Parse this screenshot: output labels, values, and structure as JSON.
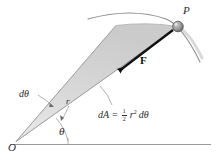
{
  "figure": {
    "type": "physics-diagram",
    "background_color": "#ffffff",
    "shade_color": "#d7d7d7",
    "line_color": "#6e6e6e",
    "vector_color": "#111111",
    "text_color": "#2b2b2b"
  },
  "labels": {
    "point_p": "P",
    "force": "F",
    "d_theta": "dθ",
    "radius": "r",
    "theta": "θ",
    "origin": "O"
  },
  "formula": {
    "lhs": "dA",
    "equals": "=",
    "fraction_numerator": "1",
    "fraction_denominator": "2",
    "radius_symbol": "r",
    "radius_exponent": "2",
    "differential": "dθ",
    "full_text": "dA = 1/2 r² dθ"
  },
  "geometry": {
    "origin_point": [
      16,
      141
    ],
    "point_p": [
      178,
      26
    ],
    "arrow_tip": [
      113,
      76
    ],
    "baseline_start": [
      10,
      144
    ],
    "baseline_end": [
      211,
      144
    ],
    "sector_outer_start": [
      116,
      25
    ],
    "sector_outer_end": [
      178,
      26
    ]
  }
}
